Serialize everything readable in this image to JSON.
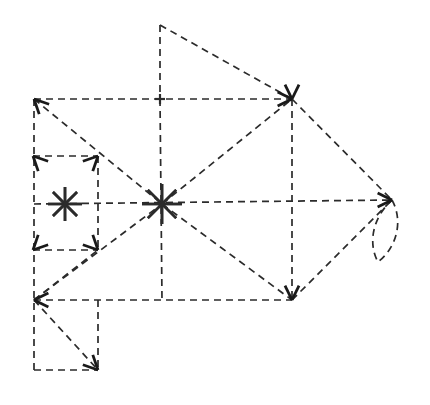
{
  "figure": {
    "canvas": {
      "width": 430,
      "height": 405
    },
    "background_color": "#ffffff",
    "stroke_color": "#2b2b2b",
    "stroke_width": 1.7,
    "dash_pattern": "7 5",
    "arrowhead_color": "#1a1a1a"
  },
  "nodes": [
    {
      "id": "apex-top",
      "label": "top apex",
      "x": 160,
      "y": 25,
      "marker": "none"
    },
    {
      "id": "corner-top-left",
      "label": "upper left corner",
      "x": 34,
      "y": 99,
      "marker": "arrow-up-left"
    },
    {
      "id": "mid-top",
      "label": "top mid junction",
      "x": 160,
      "y": 99,
      "marker": "cross"
    },
    {
      "id": "corner-top-right",
      "label": "upper right corner",
      "x": 292,
      "y": 99,
      "marker": "arrow-converge"
    },
    {
      "id": "star-small",
      "label": "small star node",
      "x": 65,
      "y": 204,
      "marker": "star8"
    },
    {
      "id": "star-center",
      "label": "center star node",
      "x": 162,
      "y": 204,
      "marker": "star8"
    },
    {
      "id": "tip-right",
      "label": "right arrow tip",
      "x": 392,
      "y": 200,
      "marker": "arrow-right"
    },
    {
      "id": "mid-left",
      "label": "left mid junction",
      "x": 34,
      "y": 204,
      "marker": "none"
    },
    {
      "id": "mid-right",
      "label": "right mid junction",
      "x": 292,
      "y": 204,
      "marker": "none"
    },
    {
      "id": "corner-bot-left",
      "label": "lower left corner",
      "x": 34,
      "y": 300,
      "marker": "arrow-left"
    },
    {
      "id": "mid-bot",
      "label": "bottom mid junction",
      "x": 162,
      "y": 300,
      "marker": "none"
    },
    {
      "id": "corner-bot-right",
      "label": "lower right corner",
      "x": 292,
      "y": 300,
      "marker": "arrow-down"
    },
    {
      "id": "sq-in-tl",
      "label": "inner square top left",
      "x": 33,
      "y": 156,
      "marker": "arrow-corner"
    },
    {
      "id": "sq-in-tr",
      "label": "inner square top right",
      "x": 98,
      "y": 156,
      "marker": "arrow-corner"
    },
    {
      "id": "sq-in-bl",
      "label": "inner square bot left",
      "x": 33,
      "y": 250,
      "marker": "arrow-corner"
    },
    {
      "id": "sq-in-br",
      "label": "inner square bot right",
      "x": 98,
      "y": 250,
      "marker": "arrow-corner"
    },
    {
      "id": "tail-bl",
      "label": "tail bottom left",
      "x": 34,
      "y": 370,
      "marker": "none"
    },
    {
      "id": "tail-br",
      "label": "tail bottom right",
      "x": 98,
      "y": 370,
      "marker": "arrow-down-right"
    },
    {
      "id": "tail-tr",
      "label": "tail top right",
      "x": 98,
      "y": 300,
      "marker": "none"
    },
    {
      "id": "petal-bottom",
      "label": "petal loop bottom",
      "x": 378,
      "y": 262,
      "marker": "none"
    }
  ],
  "edges": [
    {
      "id": "e-apex-down",
      "name": "apex to top mid",
      "x1": 160,
      "y1": 25,
      "x2": 160,
      "y2": 99,
      "kind": "dashed"
    },
    {
      "id": "e-apex-diag",
      "name": "apex to upper right",
      "x1": 160,
      "y1": 25,
      "x2": 292,
      "y2": 99,
      "kind": "dashed"
    },
    {
      "id": "e-top-edge",
      "name": "top horizontal edge",
      "x1": 34,
      "y1": 99,
      "x2": 292,
      "y2": 99,
      "kind": "dashed"
    },
    {
      "id": "e-left-edge",
      "name": "left vertical edge",
      "x1": 34,
      "y1": 99,
      "x2": 34,
      "y2": 370,
      "kind": "dashed"
    },
    {
      "id": "e-right-edge",
      "name": "right vertical edge",
      "x1": 292,
      "y1": 99,
      "x2": 292,
      "y2": 300,
      "kind": "dashed"
    },
    {
      "id": "e-mid-horiz",
      "name": "middle horizontal edge",
      "x1": 34,
      "y1": 204,
      "x2": 392,
      "y2": 200,
      "kind": "dashed"
    },
    {
      "id": "e-bot-edge",
      "name": "bottom horizontal edge",
      "x1": 34,
      "y1": 300,
      "x2": 292,
      "y2": 300,
      "kind": "dashed"
    },
    {
      "id": "e-mid-vert",
      "name": "center vertical edge",
      "x1": 160,
      "y1": 99,
      "x2": 162,
      "y2": 300,
      "kind": "dashed"
    },
    {
      "id": "e-diag-tl-c",
      "name": "upper left to center",
      "x1": 34,
      "y1": 99,
      "x2": 162,
      "y2": 204,
      "kind": "dashed"
    },
    {
      "id": "e-diag-c-tr",
      "name": "center to upper right",
      "x1": 162,
      "y1": 204,
      "x2": 292,
      "y2": 99,
      "kind": "dashed"
    },
    {
      "id": "e-diag-bl-c",
      "name": "lower left to center",
      "x1": 34,
      "y1": 300,
      "x2": 162,
      "y2": 204,
      "kind": "dashed"
    },
    {
      "id": "e-diag-c-br",
      "name": "center to lower right",
      "x1": 162,
      "y1": 204,
      "x2": 292,
      "y2": 300,
      "kind": "dashed"
    },
    {
      "id": "e-tip-upper",
      "name": "upper right to tip",
      "x1": 292,
      "y1": 99,
      "x2": 392,
      "y2": 200,
      "kind": "dashed"
    },
    {
      "id": "e-tip-lower",
      "name": "lower right to tip",
      "x1": 292,
      "y1": 300,
      "x2": 392,
      "y2": 200,
      "kind": "dashed"
    },
    {
      "id": "e-sq-top",
      "name": "inner square top",
      "x1": 33,
      "y1": 156,
      "x2": 98,
      "y2": 156,
      "kind": "dashed"
    },
    {
      "id": "e-sq-bot",
      "name": "inner square bottom",
      "x1": 33,
      "y1": 250,
      "x2": 98,
      "y2": 250,
      "kind": "dashed"
    },
    {
      "id": "e-sq-right",
      "name": "inner square right",
      "x1": 98,
      "y1": 156,
      "x2": 98,
      "y2": 250,
      "kind": "dashed"
    },
    {
      "id": "e-tail-bot",
      "name": "tail bottom edge",
      "x1": 34,
      "y1": 370,
      "x2": 98,
      "y2": 370,
      "kind": "dashed"
    },
    {
      "id": "e-tail-right",
      "name": "tail right edge",
      "x1": 98,
      "y1": 300,
      "x2": 98,
      "y2": 370,
      "kind": "dashed"
    },
    {
      "id": "e-tail-diag",
      "name": "tail diagonal",
      "x1": 34,
      "y1": 300,
      "x2": 98,
      "y2": 370,
      "kind": "dashed"
    },
    {
      "id": "e-sq-diag",
      "name": "inner square diagonal",
      "x1": 34,
      "y1": 300,
      "x2": 98,
      "y2": 250,
      "kind": "dashed"
    }
  ],
  "petal": {
    "name": "petal loop at right tip",
    "path": "M 392 200 C 404 222 396 248 378 262 C 368 244 372 218 392 200",
    "kind": "dashed"
  },
  "stars": [
    {
      "id": "star-small",
      "name": "small asterisk node",
      "cx": 65,
      "cy": 204,
      "radius": 17,
      "rays": 8
    },
    {
      "id": "star-center",
      "name": "center asterisk node",
      "cx": 162,
      "cy": 204,
      "radius": 20,
      "rays": 8
    }
  ],
  "arrowheads": [
    {
      "id": "ah-tl-upleft",
      "name": "arrowhead up-left at upper left corner",
      "x": 34,
      "y": 99,
      "angle": 225
    },
    {
      "id": "ah-tr-left",
      "name": "arrowhead left at upper right corner",
      "x": 292,
      "y": 99,
      "angle": 0
    },
    {
      "id": "ah-tr-up",
      "name": "arrowhead up at upper right corner",
      "x": 292,
      "y": 99,
      "angle": 90
    },
    {
      "id": "ah-tip-right",
      "name": "arrowhead right at tip",
      "x": 392,
      "y": 200,
      "angle": 0
    },
    {
      "id": "ah-bl-left",
      "name": "arrowhead left at lower left corner",
      "x": 34,
      "y": 300,
      "angle": 180
    },
    {
      "id": "ah-br-down",
      "name": "arrowhead down at lower right corner",
      "x": 292,
      "y": 300,
      "angle": 90
    },
    {
      "id": "ah-sq-tl",
      "name": "arrowhead at inner square top left",
      "x": 33,
      "y": 156,
      "angle": 225
    },
    {
      "id": "ah-sq-tr",
      "name": "arrowhead at inner square top right",
      "x": 98,
      "y": 156,
      "angle": 315
    },
    {
      "id": "ah-sq-bl",
      "name": "arrowhead at inner square bottom left",
      "x": 33,
      "y": 250,
      "angle": 135
    },
    {
      "id": "ah-sq-br",
      "name": "arrowhead at inner square bottom right",
      "x": 98,
      "y": 250,
      "angle": 45
    },
    {
      "id": "ah-tail-br",
      "name": "arrowhead down-right at tail corner",
      "x": 98,
      "y": 370,
      "angle": 45
    }
  ]
}
